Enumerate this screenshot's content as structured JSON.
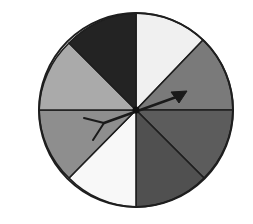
{
  "diagram": {
    "type": "spinner",
    "sector_count": 8,
    "center": [
      136,
      110
    ],
    "radius": 97,
    "outline_color": "#1e1e1e",
    "sectors": [
      {
        "from": [
          136,
          13
        ],
        "to": [
          203,
          40
        ],
        "fill": "#f0f0f0"
      },
      {
        "from": [
          203,
          40
        ],
        "to": [
          233,
          110
        ],
        "fill": "#7a7a7a"
      },
      {
        "from": [
          233,
          110
        ],
        "to": [
          204,
          178
        ],
        "fill": "#5c5c5c"
      },
      {
        "from": [
          204,
          178
        ],
        "to": [
          136,
          207
        ],
        "fill": "#505050"
      },
      {
        "from": [
          136,
          207
        ],
        "to": [
          69,
          178
        ],
        "fill": "#f8f8f8"
      },
      {
        "from": [
          69,
          178
        ],
        "to": [
          39,
          110
        ],
        "fill": "#8e8e8e"
      },
      {
        "from": [
          39,
          110
        ],
        "to": [
          69,
          43
        ],
        "fill": "#aaaaaa"
      },
      {
        "from": [
          69,
          43
        ],
        "to": [
          136,
          13
        ],
        "fill": "#232323"
      }
    ],
    "arrow": {
      "color": "#1a1a1a",
      "tail": {
        "joint": [
          104,
          123
        ],
        "feather_a": [
          84,
          118
        ],
        "feather_b": [
          93,
          140
        ]
      },
      "head": {
        "tip": [
          187,
          91
        ],
        "base_a": [
          171,
          92
        ],
        "base_b": [
          179,
          103
        ]
      }
    }
  }
}
